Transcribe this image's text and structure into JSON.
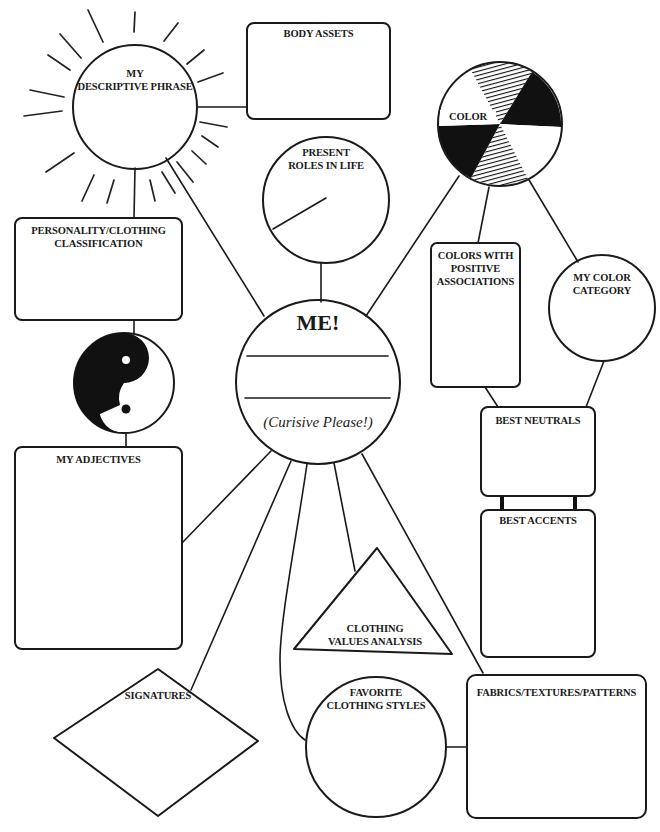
{
  "diagram": {
    "center": {
      "title": "ME!",
      "instruction": "(Curisive Please!)",
      "name_lines": 2
    },
    "nodes": {
      "descriptive_phrase": {
        "shape": "circle-with-sun-rays",
        "label_line1": "MY",
        "label_line2": "DESCRIPTIVE PHRASE"
      },
      "body_assets": {
        "shape": "rounded-rectangle",
        "label": "BODY ASSETS"
      },
      "present_roles": {
        "shape": "circle",
        "label_line1": "PRESENT",
        "label_line2": "ROLES IN LIFE"
      },
      "color": {
        "shape": "color-wheel",
        "label": "COLOR"
      },
      "colors_positive": {
        "shape": "rounded-rectangle",
        "label_line1": "COLORS WITH",
        "label_line2": "POSITIVE",
        "label_line3": "ASSOCIATIONS"
      },
      "color_category": {
        "shape": "circle",
        "label_line1": "MY COLOR",
        "label_line2": "CATEGORY"
      },
      "personality_classification": {
        "shape": "rounded-rectangle",
        "label_line1": "PERSONALITY/CLOTHING",
        "label_line2": "CLASSIFICATION"
      },
      "yin_yang": {
        "shape": "yin-yang-icon"
      },
      "adjectives": {
        "shape": "rounded-rectangle",
        "label": "MY ADJECTIVES"
      },
      "best_neutrals": {
        "shape": "rounded-rectangle",
        "label": "BEST NEUTRALS"
      },
      "best_accents": {
        "shape": "rounded-rectangle",
        "label": "BEST ACCENTS"
      },
      "clothing_values": {
        "shape": "triangle",
        "label_line1": "CLOTHING",
        "label_line2": "VALUES ANALYSIS"
      },
      "signatures": {
        "shape": "diamond",
        "label": "SIGNATURES"
      },
      "favorite_styles": {
        "shape": "circle",
        "label_line1": "FAVORITE",
        "label_line2": "CLOTHING STYLES"
      },
      "fabrics": {
        "shape": "rounded-rectangle",
        "label": "FABRICS/TEXTURES/PATTERNS"
      }
    },
    "colors": {
      "ink": "#1a1a1a",
      "paper": "#ffffff"
    }
  }
}
